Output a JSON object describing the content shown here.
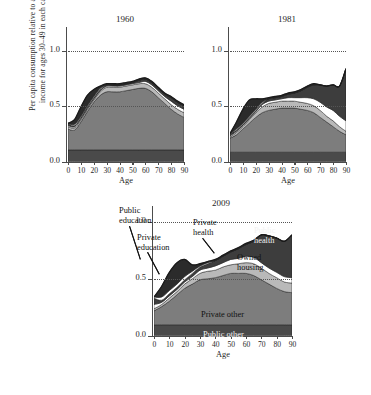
{
  "figure": {
    "ylabel": "Per capita consumption relative to average labour income for ages 30–49 in each calendar year",
    "xlabel": "Age",
    "ytick_labels": [
      "0.0",
      "0.5",
      "1.0"
    ],
    "xtick_labels": [
      "0",
      "10",
      "20",
      "30",
      "40",
      "50",
      "60",
      "70",
      "80",
      "90"
    ],
    "caption": ""
  },
  "panels": {
    "p1960": {
      "title": "1960"
    },
    "p1981": {
      "title": "1981"
    },
    "p2009": {
      "title": "2009"
    }
  },
  "annotations": {
    "public_education": "Public\neducation",
    "private_education": "Private\neducation",
    "private_health": "Private\nhealth",
    "public_health": "Public\nhealth",
    "owned_housing": "Owned\nhousing",
    "private_other": "Private other",
    "public_other": "Public other"
  },
  "colors": {
    "public_other": "#4a4a4a",
    "private_other": "#7d7d7d",
    "owned_housing": "#b9b9b9",
    "private_health": "#ffffff",
    "public_health": "#3d3d3d",
    "private_education": "#ffffff",
    "public_education": "#2b2b2b",
    "axis": "#4c4c4c",
    "grid": "#555555",
    "background": "#ffffff"
  },
  "chart_data": {
    "type": "area",
    "xlabel": "Age",
    "ylabel": "Per capita consumption relative to average labour income for ages 30–49 in each calendar year",
    "xlim": [
      0,
      90
    ],
    "ylim": [
      0.0,
      1.15
    ],
    "yticks": [
      0.0,
      0.5,
      1.0
    ],
    "xticks": [
      0,
      10,
      20,
      30,
      40,
      50,
      60,
      70,
      80,
      90
    ],
    "grid": "dotted horizontal gridline at y = 1.0 and y = 0.5",
    "legend": "in-plot annotations (no separate legend box)",
    "stack_order_bottom_to_top": [
      "Public other",
      "Private other",
      "Owned housing",
      "Private health",
      "Public health",
      "Private education",
      "Public education"
    ],
    "panels": [
      {
        "name": "1960",
        "x": [
          0,
          5,
          10,
          15,
          20,
          25,
          30,
          35,
          40,
          45,
          50,
          55,
          60,
          65,
          70,
          75,
          80,
          85,
          90
        ],
        "series": [
          {
            "name": "Public other",
            "values": [
              0.1,
              0.1,
              0.1,
              0.1,
              0.1,
              0.1,
              0.1,
              0.1,
              0.1,
              0.1,
              0.1,
              0.1,
              0.1,
              0.1,
              0.1,
              0.1,
              0.1,
              0.1,
              0.1
            ]
          },
          {
            "name": "Private other",
            "values": [
              0.18,
              0.17,
              0.24,
              0.33,
              0.41,
              0.47,
              0.5,
              0.5,
              0.5,
              0.51,
              0.52,
              0.53,
              0.53,
              0.5,
              0.45,
              0.4,
              0.35,
              0.31,
              0.28
            ]
          },
          {
            "name": "Owned housing",
            "values": [
              0.02,
              0.02,
              0.02,
              0.02,
              0.02,
              0.03,
              0.04,
              0.04,
              0.04,
              0.04,
              0.04,
              0.04,
              0.04,
              0.04,
              0.04,
              0.04,
              0.04,
              0.04,
              0.04
            ]
          },
          {
            "name": "Private health",
            "values": [
              0.01,
              0.01,
              0.01,
              0.01,
              0.01,
              0.01,
              0.01,
              0.01,
              0.01,
              0.01,
              0.01,
              0.01,
              0.02,
              0.02,
              0.02,
              0.02,
              0.03,
              0.03,
              0.03
            ]
          },
          {
            "name": "Public health",
            "values": [
              0.02,
              0.01,
              0.01,
              0.01,
              0.01,
              0.01,
              0.01,
              0.01,
              0.01,
              0.01,
              0.01,
              0.02,
              0.02,
              0.02,
              0.02,
              0.02,
              0.03,
              0.03,
              0.03
            ]
          },
          {
            "name": "Private education",
            "values": [
              0.0,
              0.01,
              0.01,
              0.01,
              0.01,
              0.01,
              0.0,
              0.0,
              0.0,
              0.0,
              0.0,
              0.0,
              0.0,
              0.0,
              0.0,
              0.0,
              0.0,
              0.0,
              0.0
            ]
          },
          {
            "name": "Public education",
            "values": [
              0.0,
              0.04,
              0.08,
              0.09,
              0.06,
              0.02,
              0.01,
              0.01,
              0.01,
              0.01,
              0.01,
              0.01,
              0.01,
              0.01,
              0.01,
              0.01,
              0.01,
              0.01,
              0.01
            ]
          }
        ],
        "total_top": [
          0.33,
          0.36,
          0.47,
          0.57,
          0.62,
          0.65,
          0.67,
          0.67,
          0.67,
          0.68,
          0.69,
          0.71,
          0.72,
          0.69,
          0.64,
          0.59,
          0.56,
          0.52,
          0.49
        ]
      },
      {
        "name": "1981",
        "x": [
          0,
          5,
          10,
          15,
          20,
          25,
          30,
          35,
          40,
          45,
          50,
          55,
          60,
          65,
          70,
          75,
          80,
          85,
          90
        ],
        "series": [
          {
            "name": "Public other",
            "values": [
              0.08,
              0.08,
              0.08,
              0.08,
              0.08,
              0.08,
              0.08,
              0.08,
              0.08,
              0.08,
              0.08,
              0.08,
              0.08,
              0.08,
              0.08,
              0.08,
              0.08,
              0.08,
              0.08
            ]
          },
          {
            "name": "Private other",
            "values": [
              0.12,
              0.15,
              0.2,
              0.25,
              0.3,
              0.34,
              0.36,
              0.37,
              0.38,
              0.38,
              0.38,
              0.37,
              0.36,
              0.34,
              0.3,
              0.26,
              0.22,
              0.18,
              0.15
            ]
          },
          {
            "name": "Owned housing",
            "values": [
              0.01,
              0.02,
              0.02,
              0.03,
              0.04,
              0.05,
              0.06,
              0.06,
              0.06,
              0.06,
              0.06,
              0.06,
              0.06,
              0.06,
              0.06,
              0.05,
              0.05,
              0.04,
              0.03
            ]
          },
          {
            "name": "Private health",
            "values": [
              0.01,
              0.01,
              0.01,
              0.01,
              0.01,
              0.02,
              0.02,
              0.02,
              0.02,
              0.03,
              0.03,
              0.04,
              0.05,
              0.06,
              0.07,
              0.08,
              0.09,
              0.09,
              0.09
            ]
          },
          {
            "name": "Public health",
            "values": [
              0.02,
              0.01,
              0.01,
              0.01,
              0.01,
              0.01,
              0.02,
              0.02,
              0.02,
              0.03,
              0.04,
              0.06,
              0.09,
              0.12,
              0.15,
              0.18,
              0.22,
              0.26,
              0.45
            ]
          },
          {
            "name": "Private education",
            "values": [
              0.0,
              0.01,
              0.01,
              0.01,
              0.01,
              0.01,
              0.0,
              0.0,
              0.0,
              0.0,
              0.0,
              0.0,
              0.0,
              0.0,
              0.0,
              0.0,
              0.0,
              0.0,
              0.0
            ]
          },
          {
            "name": "Public education",
            "values": [
              0.0,
              0.06,
              0.12,
              0.14,
              0.09,
              0.03,
              0.01,
              0.01,
              0.01,
              0.01,
              0.01,
              0.01,
              0.01,
              0.01,
              0.0,
              0.0,
              0.0,
              0.0,
              0.0
            ]
          }
        ],
        "total_top": [
          0.24,
          0.34,
          0.45,
          0.53,
          0.54,
          0.54,
          0.55,
          0.56,
          0.57,
          0.59,
          0.6,
          0.62,
          0.65,
          0.67,
          0.66,
          0.65,
          0.66,
          0.65,
          0.8
        ]
      },
      {
        "name": "2009",
        "x": [
          0,
          5,
          10,
          15,
          20,
          25,
          30,
          35,
          40,
          45,
          50,
          55,
          60,
          65,
          70,
          75,
          80,
          85,
          90
        ],
        "series": [
          {
            "name": "Public other",
            "values": [
              0.1,
              0.1,
              0.1,
              0.1,
              0.1,
              0.1,
              0.1,
              0.1,
              0.1,
              0.1,
              0.1,
              0.1,
              0.1,
              0.1,
              0.1,
              0.1,
              0.1,
              0.1,
              0.1
            ]
          },
          {
            "name": "Private other",
            "values": [
              0.13,
              0.17,
              0.22,
              0.28,
              0.34,
              0.38,
              0.42,
              0.43,
              0.44,
              0.46,
              0.48,
              0.48,
              0.48,
              0.46,
              0.42,
              0.38,
              0.34,
              0.31,
              0.3
            ]
          },
          {
            "name": "Owned housing",
            "values": [
              0.02,
              0.02,
              0.03,
              0.03,
              0.04,
              0.05,
              0.06,
              0.07,
              0.07,
              0.08,
              0.08,
              0.09,
              0.1,
              0.11,
              0.11,
              0.1,
              0.1,
              0.09,
              0.09
            ]
          },
          {
            "name": "Private health",
            "values": [
              0.04,
              0.02,
              0.02,
              0.02,
              0.02,
              0.02,
              0.03,
              0.03,
              0.04,
              0.04,
              0.05,
              0.05,
              0.06,
              0.06,
              0.05,
              0.05,
              0.05,
              0.05,
              0.05
            ]
          },
          {
            "name": "Public health",
            "values": [
              0.06,
              0.02,
              0.02,
              0.02,
              0.02,
              0.03,
              0.03,
              0.04,
              0.05,
              0.06,
              0.07,
              0.09,
              0.11,
              0.15,
              0.26,
              0.3,
              0.32,
              0.33,
              0.4
            ]
          },
          {
            "name": "Private education",
            "values": [
              0.01,
              0.03,
              0.03,
              0.03,
              0.03,
              0.02,
              0.01,
              0.01,
              0.0,
              0.0,
              0.0,
              0.0,
              0.0,
              0.0,
              0.0,
              0.0,
              0.0,
              0.0,
              0.0
            ]
          },
          {
            "name": "Public education",
            "values": [
              0.0,
              0.1,
              0.17,
              0.2,
              0.16,
              0.06,
              0.02,
              0.01,
              0.01,
              0.01,
              0.01,
              0.01,
              0.01,
              0.01,
              0.0,
              0.0,
              0.0,
              0.0,
              0.0
            ]
          }
        ],
        "total_top": [
          0.36,
          0.46,
          0.59,
          0.68,
          0.71,
          0.66,
          0.67,
          0.69,
          0.71,
          0.75,
          0.79,
          0.82,
          0.86,
          0.89,
          0.94,
          0.93,
          0.91,
          0.88,
          0.94
        ]
      }
    ]
  }
}
